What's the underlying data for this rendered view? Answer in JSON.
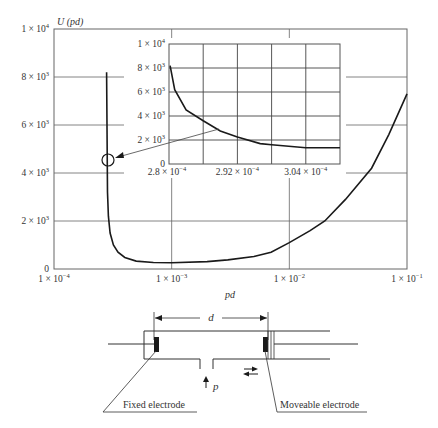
{
  "chart_data": [
    {
      "id": "main",
      "type": "line",
      "title": "",
      "ylabel": "U (pd)",
      "xlabel": "pd",
      "xscale": "log",
      "xlim": [
        0.0001,
        0.1
      ],
      "ylim": [
        0,
        10000
      ],
      "grid": true,
      "x_tick_labels": [
        {
          "value": 0.0001,
          "mant": "1 × 10",
          "exp": "−4"
        },
        {
          "value": 0.001,
          "mant": "1 × 10",
          "exp": "−3"
        },
        {
          "value": 0.01,
          "mant": "1 × 10",
          "exp": "−2"
        },
        {
          "value": 0.1,
          "mant": "1 × 10",
          "exp": "−1"
        }
      ],
      "y_tick_labels": [
        {
          "value": 0,
          "mant": "0",
          "exp": ""
        },
        {
          "value": 2000,
          "mant": "2 × 10",
          "exp": "3"
        },
        {
          "value": 4000,
          "mant": "4 × 10",
          "exp": "3"
        },
        {
          "value": 6000,
          "mant": "6 × 10",
          "exp": "3"
        },
        {
          "value": 8000,
          "mant": "8 × 10",
          "exp": "3"
        },
        {
          "value": 10000,
          "mant": "1 × 10",
          "exp": "4"
        }
      ],
      "series": [
        {
          "name": "U(pd)",
          "x": [
            0.00028,
            0.000285,
            0.00029,
            0.0003,
            0.00032,
            0.00035,
            0.0004,
            0.0005,
            0.0007,
            0.001,
            0.002,
            0.003,
            0.005,
            0.007,
            0.01,
            0.015,
            0.02,
            0.03,
            0.05,
            0.07,
            0.1
          ],
          "y": [
            8200,
            3200,
            2200,
            1500,
            1000,
            700,
            480,
            330,
            270,
            260,
            310,
            380,
            520,
            700,
            1100,
            1600,
            2000,
            2900,
            4200,
            5600,
            7300
          ]
        }
      ],
      "annotations": [
        {
          "type": "circle",
          "at_x": 0.00029,
          "at_y": 4500,
          "label": ""
        },
        {
          "type": "arrow",
          "from": "inset",
          "to": "circle"
        }
      ]
    },
    {
      "id": "inset",
      "type": "line",
      "title": "",
      "xlabel": "",
      "ylabel": "",
      "xscale": "linear",
      "xlim": [
        0.00028,
        0.00031
      ],
      "ylim": [
        0,
        10000
      ],
      "grid": true,
      "x_tick_labels": [
        {
          "value": 0.00028,
          "mant": "2.8 × 10",
          "exp": "−4"
        },
        {
          "value": 0.000292,
          "mant": "2.92 × 10",
          "exp": "−4"
        },
        {
          "value": 0.000304,
          "mant": "3.04 × 10",
          "exp": "−4"
        }
      ],
      "y_tick_labels": [
        {
          "value": 0,
          "mant": "0",
          "exp": ""
        },
        {
          "value": 2000,
          "mant": "2 × 10",
          "exp": "3"
        },
        {
          "value": 4000,
          "mant": "4 × 10",
          "exp": "3"
        },
        {
          "value": 6000,
          "mant": "6 × 10",
          "exp": "3"
        },
        {
          "value": 8000,
          "mant": "8 × 10",
          "exp": "3"
        },
        {
          "value": 10000,
          "mant": "1 × 10",
          "exp": "4"
        }
      ],
      "series": [
        {
          "name": "U(pd) zoom",
          "x": [
            0.0002802,
            0.000281,
            0.000283,
            0.000286,
            0.000289,
            0.000292,
            0.000296,
            0.000298,
            0.000304,
            0.00031
          ],
          "y": [
            8200,
            6200,
            4500,
            3600,
            2750,
            2250,
            1700,
            1600,
            1350,
            1350
          ]
        }
      ]
    }
  ],
  "diagram": {
    "dimension_label": "d",
    "pressure_label": "p",
    "fixed_electrode_label": "Fixed electrode",
    "moveable_electrode_label": "Moveable electrode"
  },
  "colors": {
    "line": "#1a1a1a",
    "grid": "#555555",
    "frame": "#666666",
    "text": "#333333"
  }
}
